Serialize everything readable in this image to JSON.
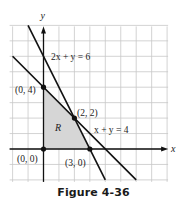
{
  "figure": {
    "caption": "Figure 4-36"
  },
  "chart_data": {
    "type": "line",
    "title": "",
    "xlabel": "x",
    "ylabel": "y",
    "xlim": [
      -2,
      8
    ],
    "ylim": [
      -2,
      8
    ],
    "grid": true,
    "grid_step": 1,
    "series": [
      {
        "name": "2x + y = 6",
        "label": "2x + y = 6",
        "x": [
          -1,
          4
        ],
        "y": [
          8,
          -2
        ],
        "color": "#111111"
      },
      {
        "name": "x + y = 4",
        "label": "x + y = 4",
        "x": [
          -2,
          6
        ],
        "y": [
          6,
          -2
        ],
        "color": "#111111"
      }
    ],
    "region": {
      "label": "R",
      "vertices": [
        [
          0,
          0
        ],
        [
          0,
          4
        ],
        [
          2,
          2
        ],
        [
          3,
          0
        ]
      ],
      "fill": "#d6d6d6"
    },
    "points": [
      {
        "x": 0,
        "y": 4,
        "label": "(0, 4)"
      },
      {
        "x": 2,
        "y": 2,
        "label": "(2, 2)"
      },
      {
        "x": 0,
        "y": 0,
        "label": "(0, 0)"
      },
      {
        "x": 3,
        "y": 0,
        "label": "(3, 0)"
      }
    ],
    "colors": {
      "grid": "#c8c8c8",
      "axis": "#111111",
      "line": "#111111",
      "region": "#d6d6d6",
      "text": "#222222"
    }
  }
}
